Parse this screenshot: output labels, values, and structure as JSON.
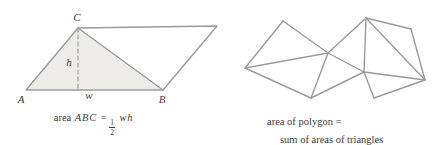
{
  "colors": {
    "stroke": "#9a9a9a",
    "shaded_fill": "#edece8",
    "text": "#3a3a3a",
    "background": "#ffffff"
  },
  "left_figure": {
    "type": "parallelogram-with-shaded-triangle",
    "labels": {
      "A": "A",
      "B": "B",
      "C": "C",
      "h": "h",
      "w": "w"
    },
    "caption": {
      "prefix": "area",
      "abc": "ABC",
      "equals": "=",
      "frac_num": "1",
      "frac_den": "2",
      "vars": "wh"
    },
    "vertices": {
      "A": [
        26,
        90
      ],
      "B": [
        163,
        90
      ],
      "C": [
        78,
        28
      ],
      "D": [
        217,
        26
      ]
    },
    "altitude_foot": [
      78,
      90
    ]
  },
  "right_figure": {
    "type": "triangulated-polygon",
    "caption_line1": "area of polygon =",
    "caption_line2": "sum of areas of triangles",
    "vertices": [
      [
        283,
        21
      ],
      [
        245,
        68
      ],
      [
        328,
        53
      ],
      [
        311,
        98
      ],
      [
        366,
        18
      ],
      [
        411,
        29
      ],
      [
        425,
        80
      ],
      [
        364,
        72
      ],
      [
        374,
        98
      ]
    ],
    "edges": [
      [
        0,
        1
      ],
      [
        0,
        2
      ],
      [
        1,
        2
      ],
      [
        1,
        3
      ],
      [
        2,
        3
      ],
      [
        2,
        4
      ],
      [
        2,
        7
      ],
      [
        3,
        7
      ],
      [
        4,
        5
      ],
      [
        4,
        6
      ],
      [
        4,
        7
      ],
      [
        5,
        6
      ],
      [
        6,
        7
      ],
      [
        6,
        8
      ],
      [
        7,
        8
      ]
    ],
    "triangle_count": 7
  }
}
